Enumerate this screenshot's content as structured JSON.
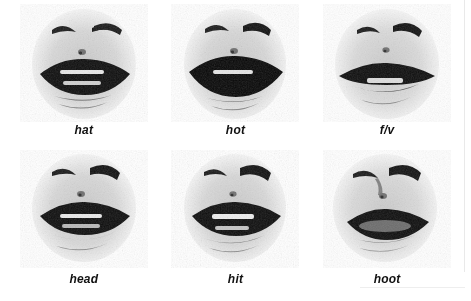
{
  "figure": {
    "kind": "viseme-grid",
    "rows": 2,
    "columns": 3,
    "background_color": "#ffffff",
    "ink_color": "#111111",
    "rendering": "halftone-dithered grayscale photograph crop"
  },
  "cells": [
    {
      "id": "hat",
      "caption": "hat",
      "row": 1,
      "column": 1,
      "mouth": {
        "state": "open",
        "aperture": "wide-open",
        "lip_width": "wide",
        "teeth_visible": "upper-and-lower",
        "jaw": "lowered"
      },
      "face_features": [
        "eyebrows",
        "nose-tip",
        "upper-lip",
        "lower-lip",
        "chin"
      ]
    },
    {
      "id": "hot",
      "caption": "hot",
      "row": 1,
      "column": 2,
      "mouth": {
        "state": "open",
        "aperture": "very-wide-open",
        "lip_width": "wide",
        "teeth_visible": "upper",
        "jaw": "lowered"
      },
      "face_features": [
        "eyebrows",
        "nose-tip",
        "upper-lip",
        "lower-lip",
        "chin"
      ]
    },
    {
      "id": "f-v",
      "caption": "f/v",
      "row": 1,
      "column": 3,
      "mouth": {
        "state": "near-closed",
        "aperture": "narrow-slit",
        "lip_width": "wide",
        "teeth_visible": "upper-on-lower-lip",
        "jaw": "raised"
      },
      "face_features": [
        "eyebrows",
        "nose-tip",
        "upper-lip",
        "lower-lip",
        "chin"
      ]
    },
    {
      "id": "head",
      "caption": "head",
      "row": 2,
      "column": 1,
      "mouth": {
        "state": "open",
        "aperture": "mid-open",
        "lip_width": "wide",
        "teeth_visible": "upper-and-lower",
        "jaw": "slightly-lowered"
      },
      "face_features": [
        "eyebrows",
        "nose-tip",
        "upper-lip",
        "lower-lip",
        "chin"
      ]
    },
    {
      "id": "hit",
      "caption": "hit",
      "row": 2,
      "column": 2,
      "mouth": {
        "state": "open",
        "aperture": "mid-open",
        "lip_width": "wide",
        "teeth_visible": "upper-and-lower",
        "jaw": "slightly-lowered"
      },
      "face_features": [
        "eyebrows",
        "nose-tip",
        "upper-lip",
        "lower-lip",
        "chin"
      ]
    },
    {
      "id": "hoot",
      "caption": "hoot",
      "row": 2,
      "column": 3,
      "mouth": {
        "state": "rounded",
        "aperture": "small-rounded",
        "lip_width": "narrow-protruded",
        "teeth_visible": "none",
        "jaw": "raised"
      },
      "face_features": [
        "eyebrows",
        "nose-tip",
        "upper-lip",
        "lower-lip",
        "chin"
      ]
    }
  ]
}
